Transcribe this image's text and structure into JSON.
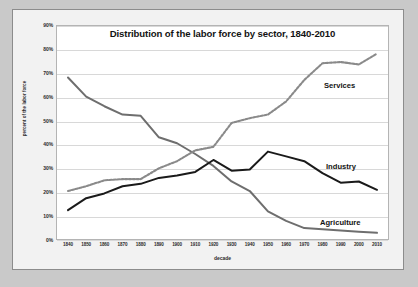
{
  "chart_data": {
    "type": "line",
    "title": "Distribution of the labor force by sector, 1840-2010",
    "xlabel": "decade",
    "ylabel": "percent of the labor force",
    "x": [
      1840,
      1850,
      1860,
      1870,
      1880,
      1890,
      1900,
      1910,
      1920,
      1930,
      1940,
      1950,
      1960,
      1970,
      1980,
      1990,
      2000,
      2010
    ],
    "categories": [
      "1840",
      "1850",
      "1860",
      "1870",
      "1880",
      "1890",
      "1900",
      "1910",
      "1920",
      "1930",
      "1940",
      "1950",
      "1960",
      "1970",
      "1980",
      "1990",
      "2000",
      "2010"
    ],
    "ylim": [
      0,
      90
    ],
    "ytick_labels": [
      "0%",
      "10%",
      "20%",
      "30%",
      "40%",
      "50%",
      "60%",
      "70%",
      "80%",
      "90%"
    ],
    "ytick_values": [
      0,
      10,
      20,
      30,
      40,
      50,
      60,
      70,
      80,
      90
    ],
    "grid": "horizontal",
    "legend": "inline-annotations",
    "series": [
      {
        "name": "Agriculture",
        "color": "#6e6e6e",
        "style": "solid",
        "values": [
          68,
          60,
          56,
          52.5,
          52,
          43,
          40.5,
          36,
          31,
          24.5,
          20.5,
          12,
          8,
          5,
          4.5,
          4,
          3.5,
          3
        ]
      },
      {
        "name": "Industry",
        "color": "#1a1a1a",
        "style": "solid",
        "values": [
          12.5,
          17.5,
          19.5,
          22.5,
          23.5,
          26,
          27,
          28.5,
          33.5,
          29,
          29.5,
          37,
          35,
          33,
          28,
          24,
          24.5,
          21
        ]
      },
      {
        "name": "Services",
        "color": "#8a8a8a",
        "style": "dashed",
        "values": [
          20.5,
          22.5,
          25,
          25.5,
          25.5,
          30,
          33,
          37.5,
          39,
          49,
          51,
          52.5,
          58,
          67,
          74,
          74.5,
          73.5,
          78
        ]
      }
    ]
  },
  "labels": {
    "services": "Services",
    "industry": "Industry",
    "agriculture": "Agriculture"
  },
  "colors": {
    "page_background": "#c9c9c9",
    "card_background": "#f2f2f2",
    "plot_background": "#ffffff",
    "gridline": "#d8d8d8",
    "text": "#131313",
    "agriculture": "#6e6e6e",
    "industry": "#1a1a1a",
    "services": "#8a8a8a"
  }
}
